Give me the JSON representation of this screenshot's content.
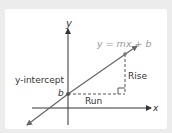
{
  "diagram": {
    "equation": "y = mx + b",
    "labels": {
      "y_axis": "y",
      "x_axis": "x",
      "intercept_label": "y-intercept",
      "intercept_point": "b",
      "rise": "Rise",
      "run": "Run"
    },
    "colors": {
      "background": "#ececec",
      "panel": "#ffffff",
      "axis": "#333333",
      "line": "#666666",
      "equation_text": "#999999",
      "dashed": "#555555"
    }
  }
}
